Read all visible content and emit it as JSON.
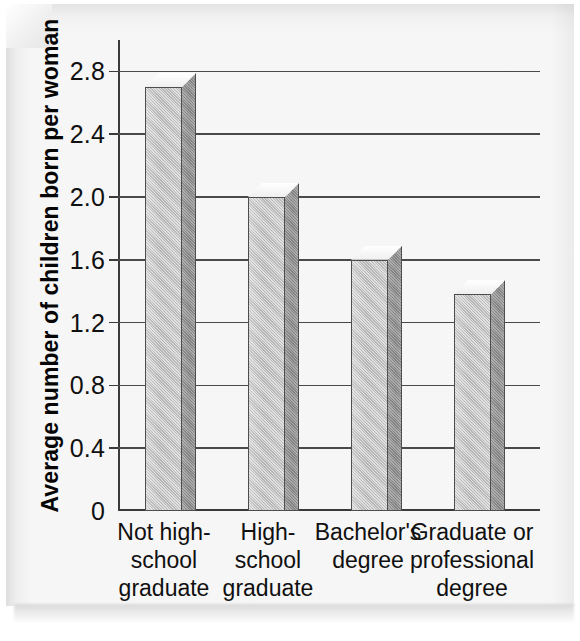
{
  "chart_data": {
    "type": "bar",
    "title": "",
    "xlabel": "",
    "ylabel": "Average number of children born per woman",
    "categories": [
      "Not high-\nschool\ngraduate",
      "High-\nschool\ngraduate",
      "Bachelor's\ndegree",
      "Graduate or\nprofessional\ndegree"
    ],
    "category_lines": [
      [
        "Not high-",
        "school",
        "graduate"
      ],
      [
        "High-",
        "school",
        "graduate"
      ],
      [
        "Bachelor's",
        "degree"
      ],
      [
        "Graduate or",
        "professional",
        "degree"
      ]
    ],
    "values": [
      2.7,
      2.0,
      1.6,
      1.38
    ],
    "ylim": [
      0,
      3.0
    ],
    "yticks": [
      0,
      0.4,
      0.8,
      1.2,
      1.6,
      2.0,
      2.4,
      2.8
    ],
    "ytick_labels": [
      "0",
      "0.4",
      "0.8",
      "1.2",
      "1.6",
      "2.0",
      "2.4",
      "2.8"
    ],
    "grid": true,
    "legend": false,
    "style": "3d-column",
    "colors": {
      "bar_front": "#b9b9b9",
      "bar_side": "#868686",
      "bar_outline": "#4d4d4d",
      "axis": "#3a3a3a",
      "gridline": "#4a4a4a",
      "text": "#101010",
      "background": "#fbfbfb"
    }
  }
}
